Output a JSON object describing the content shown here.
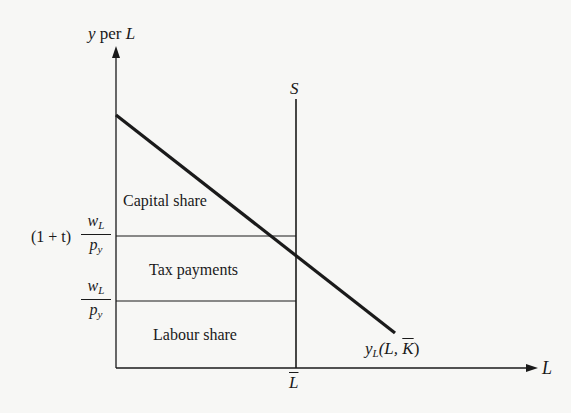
{
  "axes": {
    "y_label_var": "y",
    "y_label_text": " per ",
    "y_label_unit": "L",
    "x_label": "L"
  },
  "curves": {
    "supply_label": "S",
    "product_label_var": "y",
    "product_label_sub": "L",
    "product_label_args_open": "(L, ",
    "product_label_args_bar": "K",
    "product_label_args_close": ")"
  },
  "ticks": {
    "x_tick": "L",
    "upper_prefix": "(1 + t)",
    "upper_num_var": "w",
    "upper_num_sub": "L",
    "upper_den_var": "p",
    "upper_den_sub": "y",
    "lower_num_var": "w",
    "lower_num_sub": "L",
    "lower_den_var": "p",
    "lower_den_sub": "y"
  },
  "regions": {
    "capital": "Capital share",
    "tax": "Tax payments",
    "labour": "Labour share"
  },
  "colors": {
    "ink": "#1a1a1a",
    "background": "#f7f7f5"
  }
}
